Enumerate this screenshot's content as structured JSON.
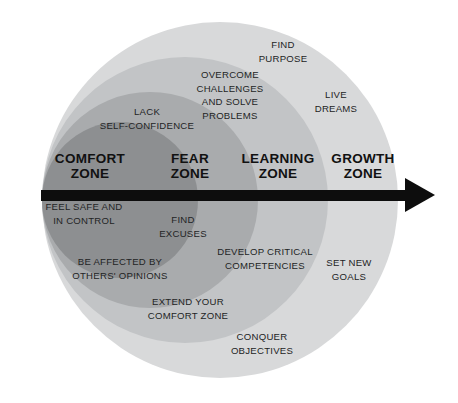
{
  "diagram": {
    "type": "concentric-zone-diagram",
    "background_color": "#ffffff",
    "arrow": {
      "name": "progress-arrow",
      "direction": "left-to-right",
      "color": "#0d0d0d"
    },
    "zones": [
      {
        "id": "comfort",
        "label_line1": "COMFORT",
        "label_line2": "ZONE",
        "color": "#8d8f91"
      },
      {
        "id": "fear",
        "label_line1": "FEAR",
        "label_line2": "ZONE",
        "color": "#a9abad"
      },
      {
        "id": "learning",
        "label_line1": "LEARNING",
        "label_line2": "ZONE",
        "color": "#c2c4c6"
      },
      {
        "id": "growth",
        "label_line1": "GROWTH",
        "label_line2": "ZONE",
        "color": "#d8d9da"
      }
    ],
    "items": [
      {
        "id": "find-purpose",
        "zone": "growth",
        "line1": "FIND",
        "line2": "PURPOSE",
        "line3": "",
        "line4": ""
      },
      {
        "id": "overcome-challenges",
        "zone": "learning",
        "line1": "OVERCOME",
        "line2": "CHALLENGES",
        "line3": "AND SOLVE",
        "line4": "PROBLEMS"
      },
      {
        "id": "live-dreams",
        "zone": "growth",
        "line1": "LIVE",
        "line2": "DREAMS",
        "line3": "",
        "line4": ""
      },
      {
        "id": "lack-self-confidence",
        "zone": "fear",
        "line1": "LACK",
        "line2": "SELF-CONFIDENCE",
        "line3": "",
        "line4": ""
      },
      {
        "id": "feel-safe-in-control",
        "zone": "comfort",
        "line1": "FEEL SAFE AND",
        "line2": "IN CONTROL",
        "line3": "",
        "line4": ""
      },
      {
        "id": "find-excuses",
        "zone": "fear",
        "line1": "FIND",
        "line2": "EXCUSES",
        "line3": "",
        "line4": ""
      },
      {
        "id": "develop-critical-competencies",
        "zone": "learning",
        "line1": "DEVELOP CRITICAL",
        "line2": "COMPETENCIES",
        "line3": "",
        "line4": ""
      },
      {
        "id": "set-new-goals",
        "zone": "growth",
        "line1": "SET NEW",
        "line2": "GOALS",
        "line3": "",
        "line4": ""
      },
      {
        "id": "be-affected-by-others-opinions",
        "zone": "fear",
        "line1": "BE AFFECTED BY",
        "line2": "OTHERS' OPINIONS",
        "line3": "",
        "line4": ""
      },
      {
        "id": "extend-your-comfort-zone",
        "zone": "learning",
        "line1": "EXTEND YOUR",
        "line2": "COMFORT ZONE",
        "line3": "",
        "line4": ""
      },
      {
        "id": "conquer-objectives",
        "zone": "growth",
        "line1": "CONQUER",
        "line2": "OBJECTIVES",
        "line3": "",
        "line4": ""
      }
    ]
  }
}
